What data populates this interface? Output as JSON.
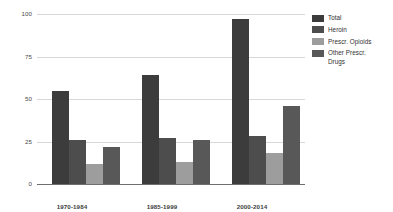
{
  "chart_data": {
    "type": "bar",
    "title": "",
    "subtitle": "",
    "xlabel": "",
    "ylabel": "",
    "categories": [
      "1970-1984",
      "1985-1999",
      "2000-2014"
    ],
    "series": [
      {
        "name": "Total",
        "values": [
          55,
          64,
          97
        ],
        "color": "#3c3c3c"
      },
      {
        "name": "Heroin",
        "values": [
          26,
          27,
          28
        ],
        "color": "#4d4d4d"
      },
      {
        "name": "Prescr. Opioids",
        "values": [
          12,
          13,
          18
        ],
        "color": "#9d9d9d"
      },
      {
        "name": "Other Prescr.\nDrugs",
        "values": [
          22,
          26,
          46
        ],
        "color": "#585858"
      }
    ],
    "ylim": [
      0,
      100
    ],
    "yticks": [
      0,
      25,
      50,
      75,
      100
    ],
    "ytick_labels": [
      "0",
      "25",
      "50",
      "75",
      "100"
    ],
    "grid": true,
    "legend_position": "right",
    "background_color": "#ffffff",
    "gridline_color": "#d8d8d8",
    "axis_color": "#6e6e6e"
  },
  "legend": {
    "entries": [
      {
        "label": "Total"
      },
      {
        "label": "Heroin"
      },
      {
        "label": "Prescr. Opioids"
      },
      {
        "label": "Other Prescr.\nDrugs"
      }
    ]
  }
}
